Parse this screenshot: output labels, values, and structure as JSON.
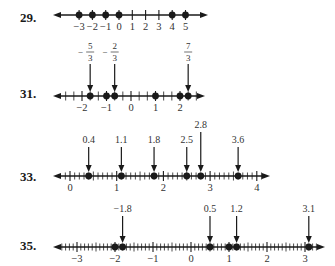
{
  "problems": [
    {
      "number": "29.",
      "label_pos": [
        20,
        22
      ],
      "line": {
        "y": 15,
        "x_start": 53,
        "x_end": 208,
        "unit_px": 13.3,
        "origin_x": 119,
        "min": -3,
        "max": 5,
        "tick_step": 1
      },
      "tick_labels": [
        {
          "value": -3,
          "text": "−3"
        },
        {
          "value": -2,
          "text": "−2"
        },
        {
          "value": -1,
          "text": "−1"
        },
        {
          "value": 0,
          "text": "0"
        },
        {
          "value": 1,
          "text": "1"
        },
        {
          "value": 2,
          "text": "2"
        },
        {
          "value": 3,
          "text": "3"
        },
        {
          "value": 4,
          "text": "4"
        },
        {
          "value": 5,
          "text": "5"
        }
      ],
      "points": [
        -3,
        -2,
        -1,
        0,
        4,
        5
      ],
      "arrows": []
    },
    {
      "number": "31.",
      "label_pos": [
        20,
        98
      ],
      "line": {
        "y": 96,
        "x_start": 53,
        "x_end": 205,
        "unit_px": 24.5,
        "origin_x": 131,
        "min": -3,
        "max": 2.67,
        "tick_step": 0.3333333333
      },
      "tick_labels": [
        {
          "value": -2,
          "text": "−2"
        },
        {
          "value": -1,
          "text": "−1"
        },
        {
          "value": 0,
          "text": "0"
        },
        {
          "value": 1,
          "text": "1"
        },
        {
          "value": 2,
          "text": "2"
        }
      ],
      "points": [
        -1.6666667,
        -1,
        -0.6666667,
        1,
        2,
        2.3333333
      ],
      "arrows": [
        {
          "value": -1.6666667,
          "text_num": "5",
          "text_den": "3",
          "sign": "−",
          "label_y": 50
        },
        {
          "value": -0.6666667,
          "text_num": "2",
          "text_den": "3",
          "sign": "−",
          "label_y": 50
        },
        {
          "value": 2.3333333,
          "text_num": "7",
          "text_den": "3",
          "sign": "",
          "label_y": 50
        }
      ]
    },
    {
      "number": "33.",
      "label_pos": [
        20,
        181
      ],
      "line": {
        "y": 176,
        "x_start": 53,
        "x_end": 270,
        "unit_px": 46.7,
        "origin_x": 70,
        "min": -0.3,
        "max": 4.2,
        "tick_step": 0.1
      },
      "tick_labels": [
        {
          "value": 0,
          "text": "0"
        },
        {
          "value": 1,
          "text": "1"
        },
        {
          "value": 2,
          "text": "2"
        },
        {
          "value": 3,
          "text": "3"
        },
        {
          "value": 4,
          "text": "4"
        }
      ],
      "points": [
        0.4,
        1.1,
        1.8,
        2.5,
        2.8,
        3.6
      ],
      "arrows": [
        {
          "value": 0.4,
          "text": "0.4",
          "label_y": 143
        },
        {
          "value": 1.1,
          "text": "1.1",
          "label_y": 143
        },
        {
          "value": 1.8,
          "text": "1.8",
          "label_y": 143
        },
        {
          "value": 2.5,
          "text": "2.5",
          "label_y": 143
        },
        {
          "value": 2.8,
          "text": "2.8",
          "label_y": 128
        },
        {
          "value": 3.6,
          "text": "3.6",
          "label_y": 143
        }
      ]
    },
    {
      "number": "35.",
      "label_pos": [
        20,
        250
      ],
      "line": {
        "y": 247,
        "x_start": 53,
        "x_end": 325,
        "unit_px": 38,
        "origin_x": 191,
        "min": -3.5,
        "max": 3.3,
        "tick_step": 0.1
      },
      "tick_labels": [
        {
          "value": -3,
          "text": "−3"
        },
        {
          "value": -2,
          "text": "−2"
        },
        {
          "value": -1,
          "text": "−1"
        },
        {
          "value": 0,
          "text": "0"
        },
        {
          "value": 1,
          "text": "1"
        },
        {
          "value": 2,
          "text": "2"
        },
        {
          "value": 3,
          "text": "3"
        }
      ],
      "points": [
        -2,
        -1.8,
        0.5,
        1,
        1.2,
        3.1
      ],
      "arrows": [
        {
          "value": -1.8,
          "text": "−1.8",
          "label_y": 212
        },
        {
          "value": 0.5,
          "text": "0.5",
          "label_y": 212
        },
        {
          "value": 1.2,
          "text": "1.2",
          "label_y": 212
        },
        {
          "value": 3.1,
          "text": "3.1",
          "label_y": 212
        }
      ]
    }
  ],
  "colors": {
    "ink": "#1a1a1a",
    "text": "#333333",
    "background": "#ffffff"
  }
}
